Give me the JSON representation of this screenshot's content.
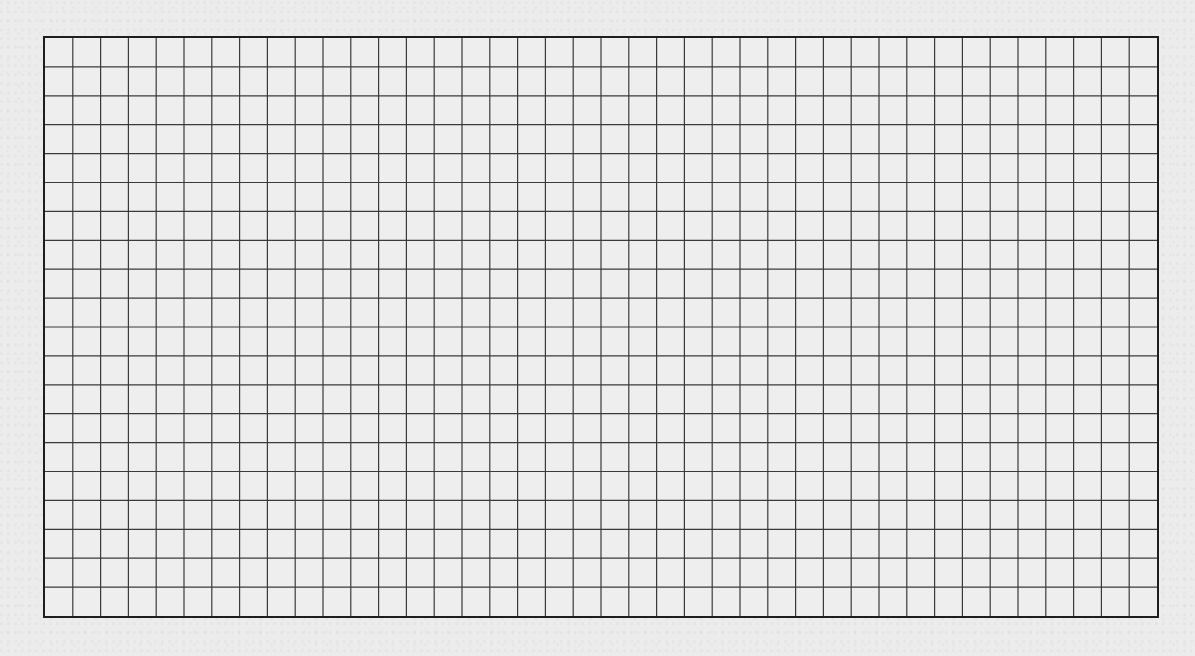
{
  "worksheet": {
    "type": "graph-paper-grid",
    "columns": 40,
    "rows": 20,
    "colors": {
      "background": "#ececec",
      "grid_line": "#3a3a3a",
      "border": "#1e1e1e"
    }
  }
}
